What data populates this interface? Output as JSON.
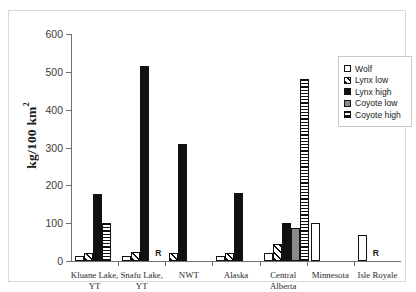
{
  "chart_data": {
    "type": "bar",
    "title": "",
    "xlabel": "",
    "ylabel": "kg/100 km",
    "ylabel_sup": "2",
    "ylim": [
      0,
      600
    ],
    "yticks": [
      0,
      100,
      200,
      300,
      400,
      500,
      600
    ],
    "grid": false,
    "legend_position": "right",
    "categories": [
      "Kluane Lake,\nYT",
      "Snafu Lake,\nYT",
      "NWT",
      "Alaska",
      "Central\nAlberta",
      "Minnesota",
      "Isle Royale"
    ],
    "series": [
      {
        "name": "Wolf",
        "pattern": "open",
        "values": [
          12,
          14,
          null,
          12,
          22,
          100,
          70
        ]
      },
      {
        "name": "Lynx low",
        "pattern": "diagonal-hatch",
        "values": [
          22,
          25,
          20,
          22,
          45,
          null,
          null
        ]
      },
      {
        "name": "Lynx high",
        "pattern": "solid-black",
        "values": [
          178,
          515,
          308,
          180,
          100,
          null,
          null
        ]
      },
      {
        "name": "Coyote low",
        "pattern": "solid-gray",
        "values": [
          null,
          null,
          null,
          null,
          88,
          null,
          null
        ]
      },
      {
        "name": "Coyote high",
        "pattern": "horizontal-stripe",
        "values": [
          100,
          null,
          null,
          null,
          480,
          null,
          null
        ]
      }
    ],
    "annotations": [
      {
        "text": "R",
        "category": "Snafu Lake,\nYT"
      },
      {
        "text": "R",
        "category": "Isle Royale"
      }
    ]
  },
  "legend": {
    "items": [
      {
        "label": "Wolf"
      },
      {
        "label": "Lynx low"
      },
      {
        "label": "Lynx high"
      },
      {
        "label": "Coyote low"
      },
      {
        "label": "Coyote high"
      }
    ]
  }
}
